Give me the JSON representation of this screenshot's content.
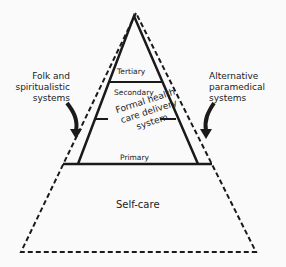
{
  "diagram": {
    "type": "pyramid",
    "levels": {
      "tertiary": "Tertiary",
      "secondary": "Secondary",
      "formal": [
        "Formal health",
        "care delivery",
        "system"
      ],
      "primary": "Primary",
      "self_care": "Self-care"
    },
    "side_labels": {
      "left": [
        "Folk and",
        "spiritualistic",
        "systems"
      ],
      "right": [
        "Alternative",
        "paramedical",
        "systems"
      ]
    },
    "colors": {
      "line": "#1a1a1a",
      "background": "#fafafa"
    }
  }
}
